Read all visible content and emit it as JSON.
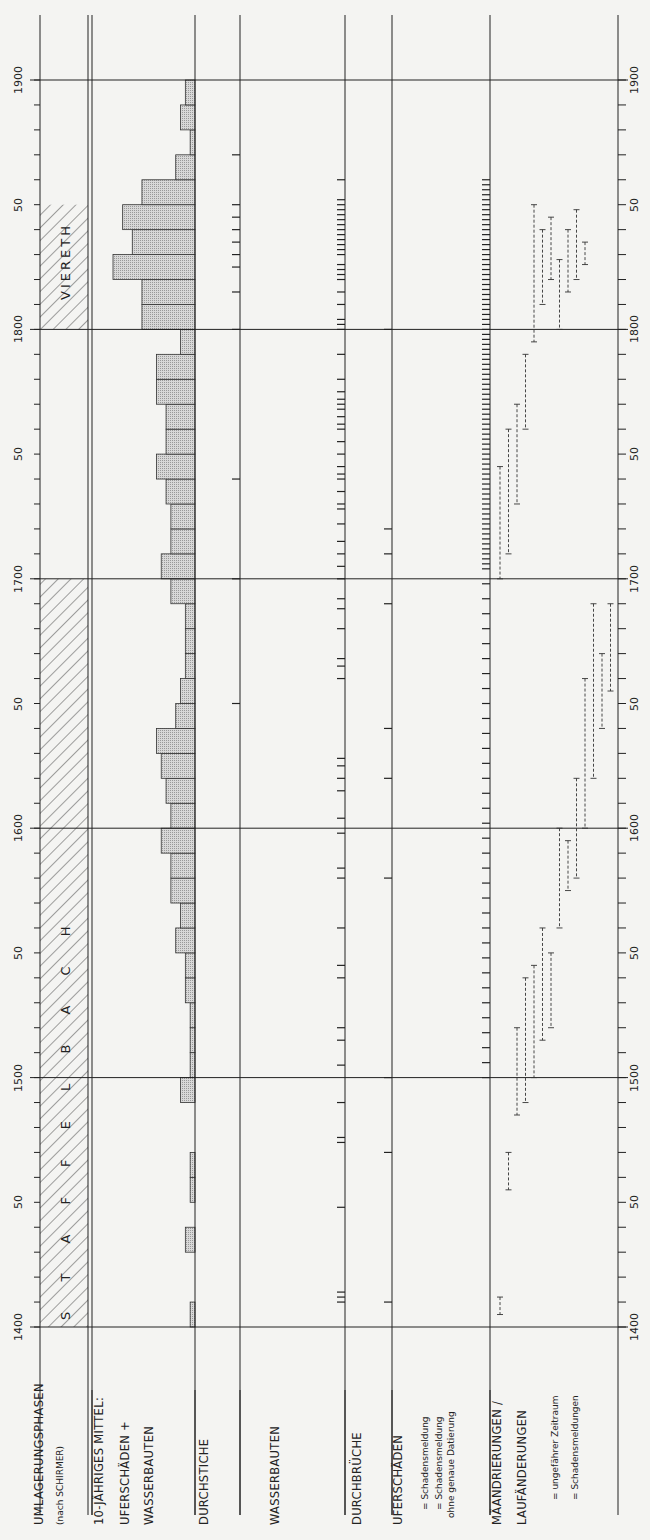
{
  "axis": {
    "years": [
      1400,
      1450,
      1500,
      1550,
      1600,
      1650,
      1700,
      1750,
      1800,
      1850,
      1900
    ],
    "labels": [
      "1400",
      "50",
      "1500",
      "50",
      "1600",
      "50",
      "1700",
      "50",
      "1800",
      "50",
      "1900"
    ]
  },
  "columns": {
    "umlagerung": {
      "title": "UMLAGERUNGSPHASEN",
      "subtitle": "(nach SCHIRMER)"
    },
    "mittel": {
      "line1": "10-JÄHRIGES MITTEL:",
      "line2": "UFERSCHÄDEN +",
      "line3": "WASSERBAUTEN"
    },
    "durchstiche": {
      "title": "DURCHSTICHE"
    },
    "wasserbauten": {
      "title": "WASSERBAUTEN"
    },
    "durchbrueche": {
      "title": "DURCHBRÜCHE"
    },
    "uferschaeden": {
      "title": "UFERSCHÄDEN",
      "legend1": "= Schadensmeldung",
      "legend2": "= Schadensmeldung",
      "legend3": "ohne genaue Datierung"
    },
    "maeandrierungen": {
      "line1": "MÄANDRIERUNGEN /",
      "line2": "LAUFÄNDERUNGEN",
      "legend1": "= ungefährer Zeitraum",
      "legend2": "= Schadensmeldungen"
    }
  },
  "phases": [
    {
      "label": "S T A F F E L B A C H",
      "start": 1400,
      "end": 1700
    },
    {
      "label": "VIERETH",
      "start": 1800,
      "end": 1850
    }
  ],
  "chart_data": {
    "type": "bar",
    "orientation": "rotated-90",
    "xlabel": "Jahr",
    "ylabel": "relative Häufigkeit",
    "categories": [
      "1400",
      "1410",
      "1420",
      "1430",
      "1440",
      "1450",
      "1460",
      "1470",
      "1480",
      "1490",
      "1500",
      "1510",
      "1520",
      "1530",
      "1540",
      "1550",
      "1560",
      "1570",
      "1580",
      "1590",
      "1600",
      "1610",
      "1620",
      "1630",
      "1640",
      "1650",
      "1660",
      "1670",
      "1680",
      "1690",
      "1700",
      "1710",
      "1720",
      "1730",
      "1740",
      "1750",
      "1760",
      "1770",
      "1780",
      "1790",
      "1800",
      "1810",
      "1820",
      "1830",
      "1840",
      "1850",
      "1860",
      "1870",
      "1880",
      "1890"
    ],
    "values": [
      1,
      0,
      0,
      2,
      0,
      1,
      1,
      0,
      0,
      3,
      1,
      1,
      1,
      2,
      2,
      4,
      3,
      5,
      5,
      7,
      5,
      6,
      7,
      8,
      4,
      3,
      2,
      2,
      2,
      5,
      7,
      5,
      5,
      6,
      8,
      6,
      6,
      8,
      8,
      3,
      11,
      11,
      17,
      13,
      15,
      11,
      4,
      1,
      3,
      2
    ],
    "ylim": [
      0,
      18
    ],
    "phase_bands": [
      {
        "name": "Staffelbach",
        "start": 1400,
        "end": 1700
      },
      {
        "name": "Viereth",
        "start": 1800,
        "end": 1850
      }
    ],
    "event_columns": [
      "Durchstiche",
      "Wasserbauten",
      "Durchbrüche",
      "Uferschäden",
      "Mäandrierungen/Laufänderungen"
    ]
  }
}
